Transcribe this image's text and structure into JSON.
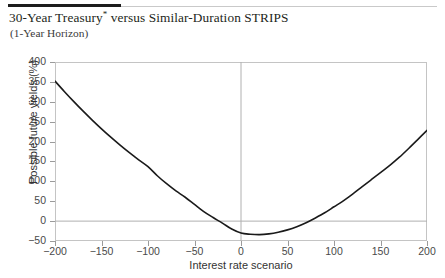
{
  "header": {
    "title_main": "30-Year Treasury",
    "title_marker": "*",
    "title_rest": " versus Similar-Duration STRIPS",
    "subtitle": "(1-Year Horizon)"
  },
  "chart_data": {
    "type": "line",
    "title": "30-Year Treasury* versus Similar-Duration STRIPS",
    "subtitle": "(1-Year Horizon)",
    "xlabel": "Interest rate scenario",
    "ylabel": "Possible future yields (%)",
    "xlim": [
      -200,
      200
    ],
    "ylim": [
      -50,
      400
    ],
    "xticks": [
      -200,
      -150,
      -100,
      -50,
      0,
      50,
      100,
      150,
      200
    ],
    "xticklabels": [
      "-200",
      "-150",
      "-100",
      "-50",
      "0",
      "50",
      "100",
      "150",
      "200"
    ],
    "yticks": [
      -50,
      0,
      50,
      100,
      150,
      200,
      250,
      300,
      350,
      400
    ],
    "yticklabels": [
      "-50",
      "0",
      "50",
      "100",
      "150",
      "200",
      "250",
      "300",
      "350",
      "400"
    ],
    "grid": false,
    "legend": null,
    "reference_lines": [
      {
        "axis": "y",
        "value": 0,
        "color": "#b0b0b0"
      },
      {
        "axis": "x",
        "value": 0,
        "color": "#b0b0b0"
      }
    ],
    "line_color": "#1a1a1a",
    "line_width": 1.6,
    "series": [
      {
        "name": "Possible future yields",
        "x": [
          -200,
          -190,
          -180,
          -170,
          -160,
          -150,
          -140,
          -130,
          -120,
          -110,
          -100,
          -90,
          -80,
          -70,
          -60,
          -50,
          -40,
          -30,
          -20,
          -10,
          0,
          10,
          20,
          30,
          40,
          50,
          60,
          70,
          80,
          90,
          100,
          110,
          120,
          130,
          140,
          150,
          160,
          170,
          180,
          190,
          200
        ],
        "y": [
          352,
          326,
          301,
          277,
          254,
          232,
          211,
          191,
          172,
          154,
          137,
          114,
          94,
          76,
          60,
          42,
          24,
          9,
          -5,
          -20,
          -30,
          -33,
          -34,
          -32,
          -28,
          -22,
          -14,
          -4,
          8,
          21,
          36,
          51,
          68,
          86,
          104,
          122,
          140,
          160,
          182,
          205,
          228
        ]
      }
    ]
  }
}
